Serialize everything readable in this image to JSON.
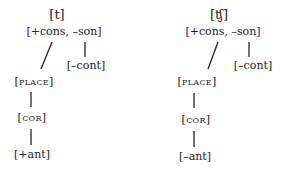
{
  "diagrams": [
    {
      "segment": "[t]",
      "root": "[+cons, –son]",
      "cont": "[–cont]",
      "place": "[place]",
      "cor": "[cor]",
      "ant": "[+ant]"
    },
    {
      "segment": "[ʧ]",
      "root": "[+cons, –son]",
      "cont": "[–cont]",
      "place": "[place]",
      "cor": "[cor]",
      "ant": "[–ant]"
    }
  ],
  "colors": {
    "ink": "#222222",
    "background": "#ffffff"
  }
}
